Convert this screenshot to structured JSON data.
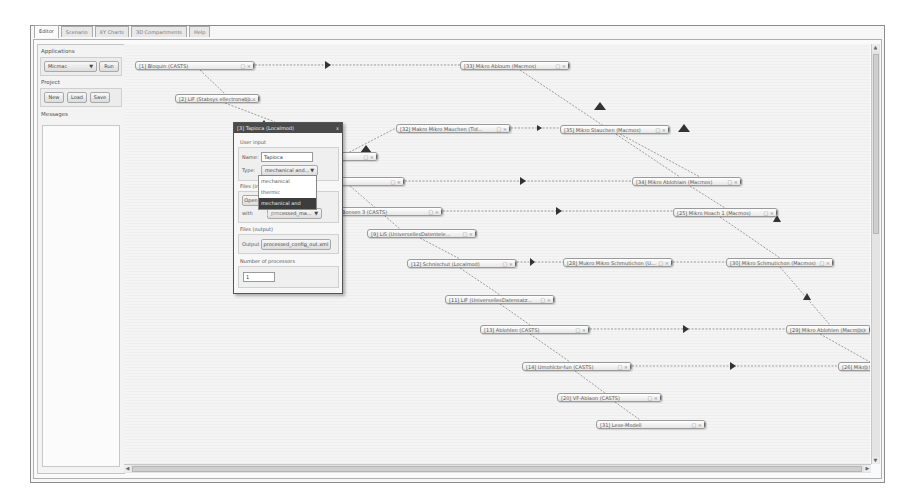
{
  "tabs": [
    {
      "label": "Editor",
      "active": true
    },
    {
      "label": "Scenario",
      "active": false
    },
    {
      "label": "XY Charts",
      "active": false
    },
    {
      "label": "3D Compartments",
      "active": false
    },
    {
      "label": "Help",
      "active": false
    }
  ],
  "left_panel": {
    "applications": {
      "title": "Applications",
      "selected": "Micmac",
      "run_label": "Run"
    },
    "project": {
      "title": "Project",
      "new_label": "New",
      "load_label": "Load",
      "save_label": "Save"
    },
    "messages": {
      "title": "Messages"
    }
  },
  "nodes": [
    {
      "id": "n1",
      "label": "[1] Bloquin (CASTS)",
      "x": 135,
      "y": 61,
      "w": 120
    },
    {
      "id": "n2",
      "label": "[2] LIF (Stabsys ellectronabo...",
      "x": 175,
      "y": 94,
      "w": 85
    },
    {
      "id": "n33",
      "label": "[33] Mikro Abloum (Macmos)",
      "x": 460,
      "y": 61,
      "w": 110
    },
    {
      "id": "n32",
      "label": "[32] Makro Mikro Mauchen (Tid...",
      "x": 396,
      "y": 124,
      "w": 115
    },
    {
      "id": "n35",
      "label": "[35] Mikro Stauchen (Macmos)",
      "x": 560,
      "y": 125,
      "w": 110
    },
    {
      "id": "n4",
      "label": "[4] ...ssp...",
      "x": 300,
      "y": 152,
      "w": 78
    },
    {
      "id": "n5",
      "label": "... (CASTS)",
      "x": 300,
      "y": 177,
      "w": 105
    },
    {
      "id": "n34",
      "label": "[34] Mikro Ablohlain (Macmos)",
      "x": 632,
      "y": 177,
      "w": 110
    },
    {
      "id": "n6",
      "label": "Bonsen 3 (CASTS)",
      "x": 338,
      "y": 207,
      "w": 105
    },
    {
      "id": "n25",
      "label": "[25] Mikro Hoach 1 (Macmos)",
      "x": 673,
      "y": 208,
      "w": 105
    },
    {
      "id": "n9",
      "label": "[9] LiS (UniversellesDatentele...",
      "x": 367,
      "y": 229,
      "w": 110
    },
    {
      "id": "n12",
      "label": "[12] Schnischut (Localmod)",
      "x": 407,
      "y": 259,
      "w": 110
    },
    {
      "id": "n28",
      "label": "[28] Mukro Mikro Schmutichon (U...",
      "x": 563,
      "y": 258,
      "w": 110
    },
    {
      "id": "n30",
      "label": "[30] Mikro Schmutichon (Macmos)",
      "x": 726,
      "y": 258,
      "w": 108
    },
    {
      "id": "n11",
      "label": "[11] LIF (UniversellesDatensatz...",
      "x": 445,
      "y": 295,
      "w": 110
    },
    {
      "id": "n13",
      "label": "[13] Ablohlen (CASTS)",
      "x": 480,
      "y": 325,
      "w": 110
    },
    {
      "id": "n29",
      "label": "[29] Mikro Ablohlen (Macmos)",
      "x": 786,
      "y": 325,
      "w": 85
    },
    {
      "id": "n14",
      "label": "[14] Umohlcbr-fun (CASTS)",
      "x": 522,
      "y": 362,
      "w": 110
    },
    {
      "id": "n26",
      "label": "[26] Mikro t",
      "x": 838,
      "y": 362,
      "w": 40
    },
    {
      "id": "n20",
      "label": "[20] VF-Ablaon (CASTS)",
      "x": 557,
      "y": 393,
      "w": 105
    },
    {
      "id": "n31",
      "label": "[31] Lese-Modell",
      "x": 596,
      "y": 420,
      "w": 110
    }
  ],
  "dialog": {
    "title": "[3] Tapioca (Localmod)",
    "close": "x",
    "user_input_title": "User input",
    "name_label": "Name:",
    "name_value": "Tapioca",
    "type_label": "Type:",
    "type_value": "mechanical and...",
    "type_options": [
      "mechanical",
      "thermic",
      "mechanical and thermic"
    ],
    "type_selected_index": 2,
    "files_input_title": "Files (input)",
    "files_input_button": "Open",
    "files_input_label": "with",
    "files_input_select": "processed_ma...",
    "files_output_title": "Files (output)",
    "output_label": "Output",
    "output_button": "processed_config_out.xml",
    "processors_title": "Number of processors",
    "processors_value": "1"
  },
  "scroll": {
    "up": "▲",
    "down": "▼",
    "left": "◀",
    "right": "▶"
  }
}
